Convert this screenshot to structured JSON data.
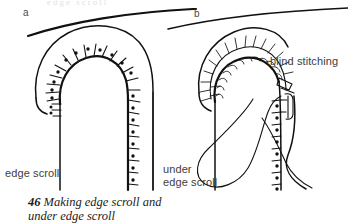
{
  "figure": {
    "panels": [
      {
        "id": "a",
        "letter": "a",
        "name": "edge-scroll-panel"
      },
      {
        "id": "b",
        "letter": "b",
        "name": "under-edge-scroll-panel"
      }
    ],
    "labels": {
      "edge_scroll": "edge scroll",
      "under_line1": "under",
      "under_line2": "edge scroll",
      "blind_stitching": "blind stitching"
    },
    "caption": {
      "number": "46",
      "line1": "Making edge scroll and",
      "line2": "under edge scroll"
    },
    "ghost_text": "edge scroll",
    "colors": {
      "ink": "#111111",
      "label_text": "#3d3d3d",
      "caption_text": "#1b1b1b",
      "background": "#ffffff"
    },
    "stitch_counts": {
      "panel_a_arch_ticks": 15,
      "panel_a_arch_dots": 11,
      "panel_a_vertical_ticks": 9,
      "panel_a_vertical_dots": 9,
      "panel_b_blind_stitches": 14,
      "panel_b_vertical_ticks": 9,
      "panel_b_vertical_dots": 9
    }
  }
}
